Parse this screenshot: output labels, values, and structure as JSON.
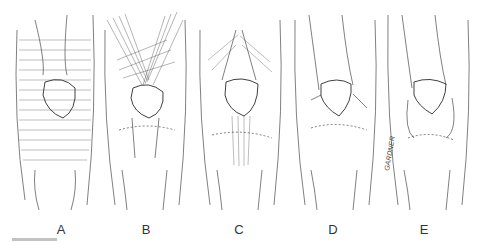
{
  "figure": {
    "panels": [
      {
        "label": "A",
        "description": "superficial quadriceps and fascia layer with horizontal hatching"
      },
      {
        "label": "B",
        "description": "cross-hatched quadriceps muscles converging over patella"
      },
      {
        "label": "C",
        "description": "quadriceps tendon and patellar tendon exposed"
      },
      {
        "label": "D",
        "description": "patella with retinaculum, tendon removed"
      },
      {
        "label": "E",
        "description": "patella with joint capsule and fat pad"
      }
    ],
    "signature": "GARDNER",
    "line_color": "#2a2a2a",
    "background": "#ffffff"
  }
}
